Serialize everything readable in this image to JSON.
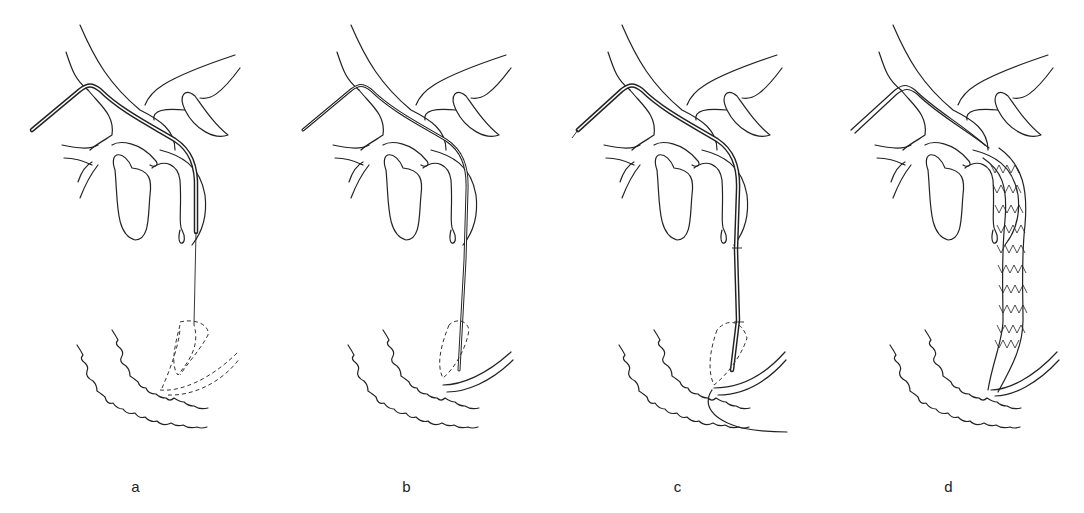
{
  "figure": {
    "panels": [
      {
        "id": "a",
        "label": "a",
        "caption_hint": "Catheter over guidewire in bile duct, wire through papilla (dashed duodenum)"
      },
      {
        "id": "b",
        "label": "b",
        "caption_hint": "Guidewire in place, catheter advanced"
      },
      {
        "id": "c",
        "label": "c",
        "caption_hint": "Stent delivery system advanced across stricture"
      },
      {
        "id": "d",
        "label": "d",
        "caption_hint": "Self-expanding metal stent deployed"
      }
    ]
  },
  "colors": {
    "line": "#222222",
    "background": "#ffffff"
  }
}
